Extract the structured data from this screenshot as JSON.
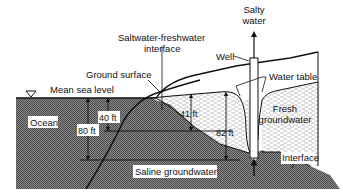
{
  "figure": {
    "type": "cross-section diagram"
  },
  "labels": {
    "salty_water": [
      "Salty",
      "water"
    ],
    "interface_top": [
      "Saltwater-freshwater",
      "interface"
    ],
    "well": "Well",
    "ground_surface": "Ground surface",
    "water_table": "Water table",
    "mean_sea_level": "Mean sea level",
    "ocean": "Ocean",
    "fresh_groundwater": [
      "Fresh",
      "groundwater"
    ],
    "interface_bottom": "Interface",
    "saline_groundwater": "Saline groundwater"
  },
  "dimensions": {
    "ocean_head_above": "40 ft",
    "ocean_depth_interface": "80 ft",
    "inland_head": "41 ft",
    "inland_depth_interface": "82 ft"
  },
  "colors": {
    "saline": "#6e6e6e",
    "fresh_bg": "#ffffff",
    "fresh_dash": "#9a9a9a",
    "line": "#111111"
  }
}
